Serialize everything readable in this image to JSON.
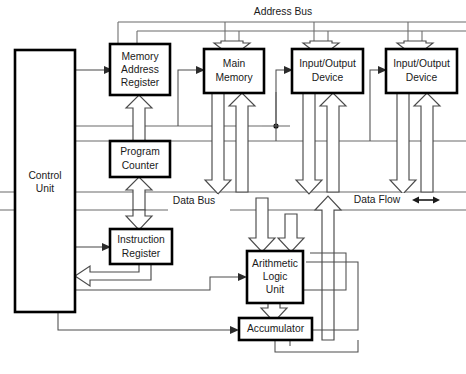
{
  "diagram": {
    "blocks": {
      "control_unit": {
        "label_line1": "Control",
        "label_line2": "Unit"
      },
      "memory_address_register": {
        "label_line1": "Memory",
        "label_line2": "Address",
        "label_line3": "Register"
      },
      "main_memory": {
        "label_line1": "Main",
        "label_line2": "Memory"
      },
      "io_device_1": {
        "label_line1": "Input/Output",
        "label_line2": "Device"
      },
      "io_device_2": {
        "label_line1": "Input/Output",
        "label_line2": "Device"
      },
      "program_counter": {
        "label_line1": "Program",
        "label_line2": "Counter"
      },
      "instruction_register": {
        "label_line1": "Instruction",
        "label_line2": "Register"
      },
      "arithmetic_logic_unit": {
        "label_line1": "Arithmetic",
        "label_line2": "Logic",
        "label_line3": "Unit"
      },
      "accumulator": {
        "label_line1": "Accumulator"
      }
    },
    "bus_labels": {
      "address_bus": "Address Bus",
      "data_bus": "Data Bus",
      "data_flow": "Data Flow"
    },
    "colors": {
      "background": "#ffffff",
      "block_outline": "#000000",
      "block_text": "#1a1a1a",
      "bus_line": "#6a6a6a",
      "control_line": "#4d4d4d",
      "dataflow_outline": "#4a4a4a",
      "dataflow_fill": "#ffffff"
    }
  }
}
